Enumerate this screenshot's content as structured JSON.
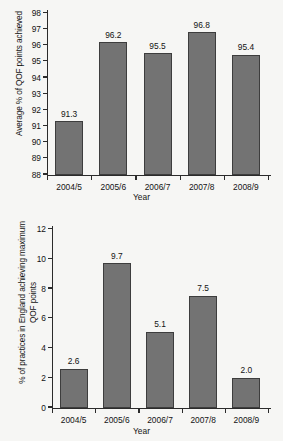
{
  "figure": {
    "background_color": "#f6f6f4",
    "bar_color": "#737373",
    "bar_edge_color": "#3d3d3d",
    "axis_color": "#2b2b2b"
  },
  "chart_data": [
    {
      "type": "bar",
      "id": "chart-average-qof-points",
      "title": "",
      "xlabel": "Year",
      "ylabel": "Average % of QOF points achieved",
      "ylabel_lines": [
        "Average % of QOF points achieved"
      ],
      "categories": [
        "2004/5",
        "2005/6",
        "2006/7",
        "2007/8",
        "2008/9"
      ],
      "values": [
        91.3,
        96.2,
        95.5,
        96.8,
        95.4
      ],
      "value_labels": [
        "91.3",
        "96.2",
        "95.5",
        "96.8",
        "95.4"
      ],
      "ylim": [
        88,
        98
      ],
      "yticks": [
        88,
        89,
        90,
        91,
        92,
        93,
        94,
        95,
        96,
        97,
        98
      ],
      "ytick_labels": [
        "88",
        "89",
        "90",
        "91",
        "92",
        "93",
        "94",
        "95",
        "96",
        "97",
        "98"
      ],
      "grid": false,
      "legend": false
    },
    {
      "type": "bar",
      "id": "chart-practices-max-qof-points",
      "title": "",
      "xlabel": "Year",
      "ylabel": "% of practices in England achieving maximum QOF points",
      "ylabel_lines": [
        "% of practices in England achieving maximum",
        "QOF points"
      ],
      "categories": [
        "2004/5",
        "2005/6",
        "2006/7",
        "2007/8",
        "2008/9"
      ],
      "values": [
        2.6,
        9.7,
        5.1,
        7.5,
        2.0
      ],
      "value_labels": [
        "2.6",
        "9.7",
        "5.1",
        "7.5",
        "2.0"
      ],
      "ylim": [
        0,
        12
      ],
      "yticks": [
        0,
        2,
        4,
        6,
        8,
        10,
        12
      ],
      "ytick_labels": [
        "0",
        "2",
        "4",
        "6",
        "8",
        "10",
        "12"
      ],
      "grid": false,
      "legend": false
    }
  ]
}
